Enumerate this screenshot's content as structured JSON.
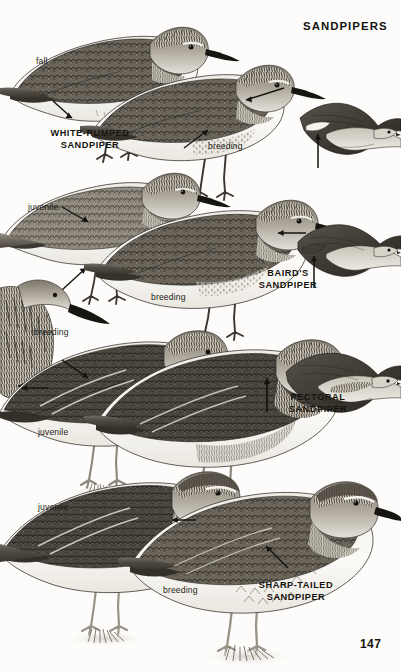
{
  "page": {
    "title": "SANDPIPERS",
    "number": "147",
    "background_color": "#fdfcfa",
    "ink_color": "#14130f"
  },
  "species_labels": [
    {
      "name": "white-rumped",
      "line1": "WHITE-RUMPED",
      "line2": "SANDPIPER",
      "x": 58,
      "y": 128
    },
    {
      "name": "bairds",
      "line1": "BAIRD'S",
      "line2": "SANDPIPER",
      "x": 283,
      "y": 268
    },
    {
      "name": "pectoral",
      "line1": "PECTORAL",
      "line2": "SANDPIPER",
      "x": 307,
      "y": 392
    },
    {
      "name": "sharp-tailed",
      "line1": "SHARP-TAILED",
      "line2": "SANDPIPER",
      "x": 293,
      "y": 580
    }
  ],
  "plumage_labels": [
    {
      "name": "fall-upper-left",
      "text": "fall",
      "x": 36,
      "y": 56
    },
    {
      "name": "breeding-upper-middle",
      "text": "breeding",
      "x": 208,
      "y": 141
    },
    {
      "name": "juvenile-mid-left",
      "text": "juvenile",
      "x": 28,
      "y": 202
    },
    {
      "name": "breeding-mid-middle",
      "text": "breeding",
      "x": 151,
      "y": 292
    },
    {
      "name": "breeding-male-left",
      "text": "breeding",
      "x": 34,
      "y": 327
    },
    {
      "name": "juvenile-lower-left",
      "text": "juvenile",
      "x": 38,
      "y": 427
    },
    {
      "name": "juvenile-bottom-left",
      "text": "juvenile",
      "x": 38,
      "y": 502
    },
    {
      "name": "breeding-bottom-middle",
      "text": "breeding",
      "x": 163,
      "y": 585
    }
  ],
  "symbols": [
    {
      "name": "male-symbol",
      "glyph": "♂",
      "x": 44,
      "y": 313
    }
  ],
  "figures": [
    {
      "name": "white-rumped-sandpiper-fall",
      "pose": "standing",
      "plumage": "fall"
    },
    {
      "name": "white-rumped-sandpiper-breeding",
      "pose": "standing",
      "plumage": "breeding"
    },
    {
      "name": "white-rumped-sandpiper-flight",
      "pose": "flying",
      "plumage": "breeding"
    },
    {
      "name": "bairds-sandpiper-juvenile",
      "pose": "standing",
      "plumage": "juvenile"
    },
    {
      "name": "bairds-sandpiper-breeding",
      "pose": "standing",
      "plumage": "breeding"
    },
    {
      "name": "bairds-sandpiper-flight",
      "pose": "flying",
      "plumage": "breeding"
    },
    {
      "name": "pectoral-sandpiper-male-breeding",
      "pose": "head-only",
      "plumage": "breeding"
    },
    {
      "name": "pectoral-sandpiper-juvenile",
      "pose": "standing",
      "plumage": "juvenile"
    },
    {
      "name": "pectoral-sandpiper-breeding",
      "pose": "standing",
      "plumage": "breeding"
    },
    {
      "name": "pectoral-sandpiper-flight",
      "pose": "flying",
      "plumage": "breeding"
    },
    {
      "name": "sharp-tailed-sandpiper-juvenile",
      "pose": "standing",
      "plumage": "juvenile"
    },
    {
      "name": "sharp-tailed-sandpiper-breeding",
      "pose": "standing",
      "plumage": "breeding"
    }
  ]
}
